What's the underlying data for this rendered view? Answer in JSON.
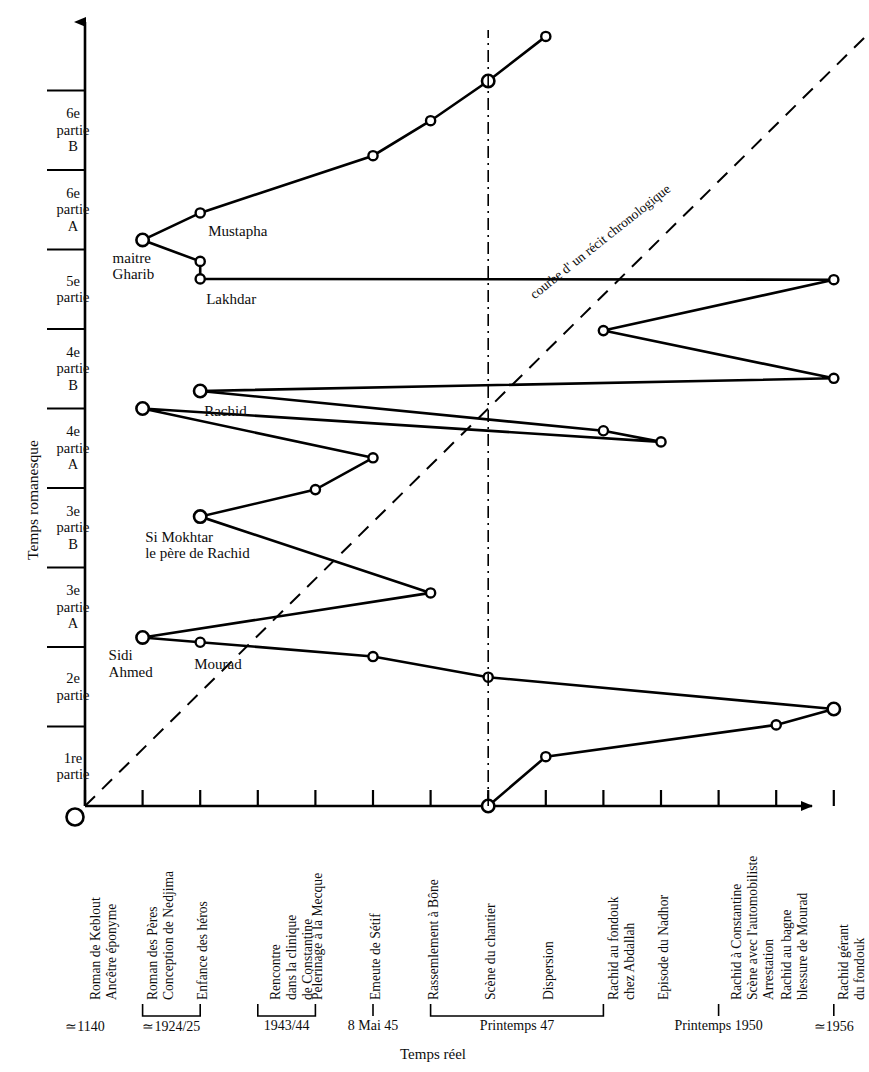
{
  "chart_data": {
    "type": "line",
    "title": "",
    "xlabel": "Temps réel",
    "ylabel": "Temps romanesque",
    "grid": false,
    "legend_position": "none",
    "ylim": [
      0,
      10
    ],
    "xlim": [
      0,
      14
    ],
    "y_categories": [
      "1re\npartie",
      "2e\npartie",
      "3e\npartie\nA",
      "3e\npartie\nB",
      "4e\npartie\nA",
      "4e\npartie\nB",
      "5e\npartie",
      "6e\npartie\nA",
      "6e\npartie\nB"
    ],
    "x_categories": [
      "Roman de Keblout\nAncêtre éponyme",
      "Roman des Pères\nConception de Nedjima",
      "Enfance des héros",
      "Rencontre\ndans la clinique\nde Constantine",
      "Pelerinage à la Mecque",
      "Emeute de Sétif",
      "Rassemlement à Bône",
      "Scène du chantier",
      "Dispersion",
      "Rachid au fondouk\nchez Abdallah",
      "Episode du Nadhor",
      "Rachid à Constantine\nScène avec l'automobiliste\nArrestation",
      "Rachid au bagne\nblessure de Mourad",
      "Rachid gérant\ndu fondouk"
    ],
    "date_groups": [
      {
        "label": "≃1140",
        "from": 0,
        "to": 0
      },
      {
        "label": "≃1924/25",
        "from": 1,
        "to": 2
      },
      {
        "label": "1943/44",
        "from": 3,
        "to": 4
      },
      {
        "label": "8 Mai 45",
        "from": 5,
        "to": 5
      },
      {
        "label": "Printemps 47",
        "from": 6,
        "to": 9
      },
      {
        "label": "Printemps 1950",
        "from": 11,
        "to": 11
      },
      {
        "label": "≃1956",
        "from": 13,
        "to": 13
      }
    ],
    "series": [
      {
        "name": "courbe du récit de Nedjma",
        "style": "solid-with-markers",
        "points": [
          {
            "x": 7,
            "y": 0.0,
            "marker": "large"
          },
          {
            "x": 8,
            "y": 0.62,
            "marker": "small"
          },
          {
            "x": 12,
            "y": 1.02,
            "marker": "small"
          },
          {
            "x": 13,
            "y": 1.22,
            "marker": "large"
          },
          {
            "x": 7,
            "y": 1.62,
            "marker": "small"
          },
          {
            "x": 5,
            "y": 1.88,
            "marker": "small"
          },
          {
            "x": 2,
            "y": 2.06,
            "marker": "small"
          },
          {
            "x": 1,
            "y": 2.12,
            "marker": "large"
          },
          {
            "x": 6,
            "y": 2.68,
            "marker": "small"
          },
          {
            "x": 2,
            "y": 3.64,
            "marker": "large"
          },
          {
            "x": 4,
            "y": 3.98,
            "marker": "small"
          },
          {
            "x": 5,
            "y": 4.38,
            "marker": "small"
          },
          {
            "x": 1,
            "y": 5.0,
            "marker": "large"
          },
          {
            "x": 10,
            "y": 4.58,
            "marker": "small"
          },
          {
            "x": 9,
            "y": 4.72,
            "marker": "small"
          },
          {
            "x": 2,
            "y": 5.22,
            "marker": "large"
          },
          {
            "x": 13,
            "y": 5.38,
            "marker": "small"
          },
          {
            "x": 9,
            "y": 5.98,
            "marker": "small"
          },
          {
            "x": 13,
            "y": 6.62,
            "marker": "small"
          },
          {
            "x": 2,
            "y": 6.63,
            "marker": "small"
          },
          {
            "x": 2,
            "y": 6.85,
            "marker": "small"
          },
          {
            "x": 1,
            "y": 7.12,
            "marker": "large"
          },
          {
            "x": 2,
            "y": 7.46,
            "marker": "small"
          },
          {
            "x": 5,
            "y": 8.18,
            "marker": "small"
          },
          {
            "x": 6,
            "y": 8.62,
            "marker": "small"
          },
          {
            "x": 7,
            "y": 9.12,
            "marker": "large"
          },
          {
            "x": 8,
            "y": 9.68,
            "marker": "small"
          }
        ]
      },
      {
        "name": "courbe d'un récit chronologique",
        "style": "dashed",
        "points": [
          {
            "x": 0,
            "y": 0
          },
          {
            "x": 14,
            "y": 10
          }
        ]
      }
    ],
    "reference_line_label": "courbe d' un récit chronologique",
    "vertical_marker_x": 7,
    "annotations": [
      {
        "text": "maitre\nGharib",
        "x": 1,
        "y": 7.12
      },
      {
        "text": "Mustapha",
        "x": 2,
        "y": 7.46
      },
      {
        "text": "Lakhdar",
        "x": 2,
        "y": 6.63
      },
      {
        "text": "Rachid",
        "x": 2,
        "y": 5.22
      },
      {
        "text": "Si Mokhtar\nle père de Rachid",
        "x": 2,
        "y": 3.64
      },
      {
        "text": "Sidi\nAhmed",
        "x": 1,
        "y": 2.12
      },
      {
        "text": "Mourad",
        "x": 2,
        "y": 2.06
      }
    ]
  },
  "axes": {
    "y_title": "Temps romanesque",
    "x_title": "Temps réel"
  },
  "colors": {
    "ink": "#0d0d0d",
    "background": "#ffffff"
  }
}
